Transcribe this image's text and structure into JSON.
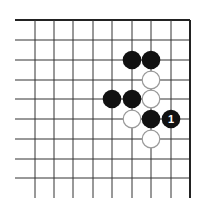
{
  "diagram": {
    "type": "go-problem",
    "region": "top-right corner",
    "grid": {
      "columns_x": [
        35,
        54,
        73,
        93,
        112,
        132,
        151,
        171,
        190
      ],
      "rows_y": [
        20,
        40,
        60,
        80,
        99,
        119,
        139,
        159,
        178
      ],
      "h_line_start_x": 15,
      "v_line_end_y": 198,
      "edges": [
        "top",
        "right"
      ],
      "line_color": "#333333",
      "edge_color": "#222222"
    },
    "stones": [
      {
        "color": "black",
        "col": 5,
        "row": 2,
        "label": ""
      },
      {
        "color": "black",
        "col": 6,
        "row": 2,
        "label": ""
      },
      {
        "color": "white",
        "col": 6,
        "row": 3,
        "label": ""
      },
      {
        "color": "black",
        "col": 4,
        "row": 4,
        "label": ""
      },
      {
        "color": "black",
        "col": 5,
        "row": 4,
        "label": ""
      },
      {
        "color": "white",
        "col": 6,
        "row": 4,
        "label": ""
      },
      {
        "color": "white",
        "col": 5,
        "row": 5,
        "label": ""
      },
      {
        "color": "black",
        "col": 6,
        "row": 5,
        "label": ""
      },
      {
        "color": "black",
        "col": 7,
        "row": 5,
        "label": "1"
      },
      {
        "color": "white",
        "col": 6,
        "row": 6,
        "label": ""
      }
    ],
    "colors": {
      "black_stone": "#111111",
      "white_stone_fill": "#ffffff",
      "white_stone_stroke": "#9a9a9a",
      "label_on_black": "#ffffff"
    }
  }
}
